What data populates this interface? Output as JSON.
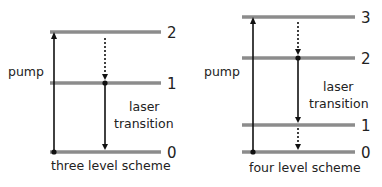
{
  "colors": {
    "level_line": "#8c8c8c",
    "arrow": "#111111",
    "text": "#222222",
    "background": "#ffffff"
  },
  "diagrams": [
    {
      "caption": "three level scheme",
      "pump_label": "pump",
      "laser_label_line1": "laser",
      "laser_label_line2": "transition",
      "levels": [
        {
          "label": "0",
          "y": 152
        },
        {
          "label": "1",
          "y": 83
        },
        {
          "label": "2",
          "y": 32
        }
      ],
      "transitions": [
        {
          "type": "pump",
          "from": "0",
          "to": "2",
          "style": "solid"
        },
        {
          "type": "nonradiative",
          "from": "2",
          "to": "1",
          "style": "dotted"
        },
        {
          "type": "laser",
          "from": "1",
          "to": "0",
          "style": "solid"
        }
      ]
    },
    {
      "caption": "four level scheme",
      "pump_label": "pump",
      "laser_label_line1": "laser",
      "laser_label_line2": "transition",
      "levels": [
        {
          "label": "0",
          "y": 152
        },
        {
          "label": "1",
          "y": 125
        },
        {
          "label": "2",
          "y": 58
        },
        {
          "label": "3",
          "y": 17
        }
      ],
      "transitions": [
        {
          "type": "pump",
          "from": "0",
          "to": "3",
          "style": "solid"
        },
        {
          "type": "nonradiative",
          "from": "3",
          "to": "2",
          "style": "dotted"
        },
        {
          "type": "laser",
          "from": "2",
          "to": "1",
          "style": "solid"
        },
        {
          "type": "nonradiative",
          "from": "1",
          "to": "0",
          "style": "dotted"
        }
      ]
    }
  ]
}
